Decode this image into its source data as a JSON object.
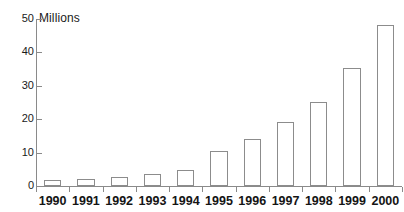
{
  "chart_data": {
    "type": "bar",
    "title": "",
    "subtitle": "",
    "unit_label": "Millions",
    "xlabel": "",
    "ylabel": "Millions",
    "categories": [
      "1990",
      "1991",
      "1992",
      "1993",
      "1994",
      "1995",
      "1996",
      "1997",
      "1998",
      "1999",
      "2000"
    ],
    "values": [
      1.7,
      2.1,
      2.7,
      3.5,
      4.9,
      10.5,
      14.2,
      19.3,
      25.2,
      35.4,
      48.3
    ],
    "ylim": [
      0,
      50
    ],
    "ytick_labels": [
      "50",
      "40",
      "30",
      "20",
      "10",
      "0"
    ],
    "ytick_values": [
      50,
      40,
      30,
      20,
      10,
      0
    ],
    "grid": false,
    "legend": false,
    "legend_position": "none",
    "annotations": [],
    "colors": {
      "bar_fill": "#ffffff",
      "bar_stroke": "#8c8c8c",
      "axis": "#8a8a8a",
      "text": "#141414",
      "background": "#ffffff"
    }
  }
}
